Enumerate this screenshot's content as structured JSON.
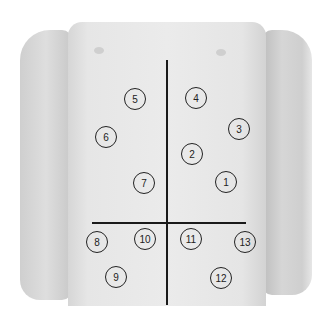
{
  "image": {
    "description": "Abdominal examination regions on torso photograph",
    "background_color": "#ffffff",
    "line_color": "#1a1a1a",
    "marker_color": "#222222",
    "vertical_line": {
      "x": 166,
      "y_start": 60,
      "y_end": 305
    },
    "horizontal_line": {
      "y": 222,
      "x_start": 92,
      "x_end": 246
    },
    "markers": [
      {
        "label": "1",
        "x": 226,
        "y": 182
      },
      {
        "label": "2",
        "x": 192,
        "y": 154
      },
      {
        "label": "3",
        "x": 239,
        "y": 129
      },
      {
        "label": "4",
        "x": 196,
        "y": 98
      },
      {
        "label": "5",
        "x": 135,
        "y": 99
      },
      {
        "label": "6",
        "x": 106,
        "y": 137
      },
      {
        "label": "7",
        "x": 144,
        "y": 183
      },
      {
        "label": "8",
        "x": 97,
        "y": 242
      },
      {
        "label": "9",
        "x": 116,
        "y": 277
      },
      {
        "label": "10",
        "x": 145,
        "y": 239
      },
      {
        "label": "11",
        "x": 191,
        "y": 239
      },
      {
        "label": "12",
        "x": 221,
        "y": 278
      },
      {
        "label": "13",
        "x": 245,
        "y": 242
      }
    ]
  }
}
